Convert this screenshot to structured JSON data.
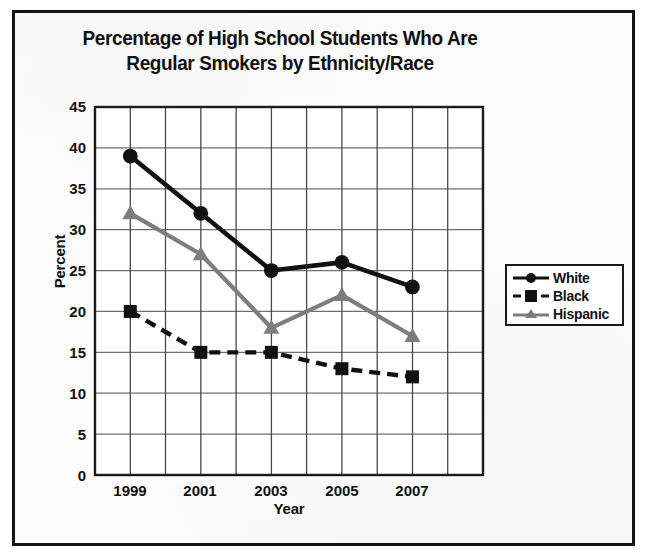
{
  "chart_data": {
    "type": "line",
    "title": "Percentage of High School Students Who Are Regular Smokers by Ethnicity/Race",
    "title_line1": "Percentage of High School Students Who Are",
    "title_line2": "Regular Smokers by Ethnicity/Race",
    "xlabel": "Year",
    "ylabel": "Percent",
    "categories": [
      "1999",
      "2001",
      "2003",
      "2005",
      "2007"
    ],
    "x": [
      1999,
      2001,
      2003,
      2005,
      2007
    ],
    "ylim": [
      0,
      45
    ],
    "ytick_step": 5,
    "yticks": [
      "45",
      "40",
      "35",
      "30",
      "25",
      "20",
      "15",
      "10",
      "5",
      "0"
    ],
    "ytick_values": [
      45,
      40,
      35,
      30,
      25,
      20,
      15,
      10,
      5,
      0
    ],
    "grid": true,
    "legend_position": "right",
    "series": [
      {
        "name": "White",
        "values": [
          39,
          32,
          25,
          26,
          23
        ],
        "color": "#111111",
        "marker": "circle",
        "line_style": "solid"
      },
      {
        "name": "Black",
        "values": [
          20,
          15,
          15,
          13,
          12
        ],
        "color": "#111111",
        "marker": "square",
        "line_style": "dashed"
      },
      {
        "name": "Hispanic",
        "values": [
          32,
          27,
          18,
          22,
          17
        ],
        "color": "#7d7d7d",
        "marker": "triangle",
        "line_style": "solid"
      }
    ]
  },
  "legend": {
    "items": [
      {
        "label": "White"
      },
      {
        "label": "Black"
      },
      {
        "label": "Hispanic"
      }
    ]
  },
  "colors": {
    "frame": "#151515",
    "axis": "#1a1a1a",
    "grid": "#6f6f6f",
    "white_series": "#111111",
    "black_series": "#111111",
    "hispanic_series": "#7d7d7d"
  }
}
